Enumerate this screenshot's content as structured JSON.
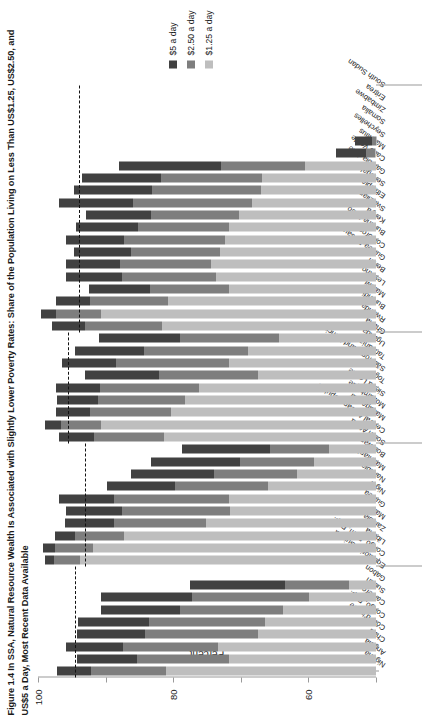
{
  "figure": {
    "title": "Figure 1.4  In SSA, Natural Resource Wealth Is Associated with Slightly Lower Poverty Rates: Share of the Population Living on Less Than US$1.25, US$2.50, and US$5 a Day, Most Recent Data Available"
  },
  "legend": {
    "position": "right",
    "items": [
      {
        "label": "$5 a day",
        "color": "#414141"
      },
      {
        "label": "$2.50 a day",
        "color": "#7e7e7e"
      },
      {
        "label": "$1.25 a day",
        "color": "#bebebe"
      }
    ]
  },
  "axis": {
    "ylabel": "Percent",
    "yticks": [
      "0",
      "20",
      "40",
      "60",
      "80",
      "100"
    ],
    "ymin": 0,
    "ymax": 100
  },
  "chart_data": {
    "type": "bar",
    "title": "Figure 1.4  In SSA, Natural Resource Wealth Is Associated with Slightly Lower Poverty Rates: Share of the Population Living on Less Than US$1.25, US$2.50, and US$5 a Day, Most Recent Data Available",
    "orientation": "horizontal-stacked",
    "stacked": true,
    "xlabel": "",
    "ylabel": "Percent",
    "ylim": [
      0,
      100
    ],
    "grid": false,
    "legend_position": "right",
    "categories": [
      "Nigeria",
      "Angola",
      "Chad",
      "Côte d'Ivoire",
      "Congo, Rep.",
      "Cameroon",
      "Sudan",
      "Gabon",
      "Equatorial Guinea",
      "Congo, Dem. Rep.",
      "Liberia",
      "Zambia",
      "Mali",
      "Guinea",
      "Niger",
      "Namibia",
      "Mauritania",
      "Botswana",
      "South Africa",
      "Central African Republic",
      "Madagascar",
      "Mozambique",
      "Sierra Leone",
      "Togo",
      "São Tomé and Príncipe",
      "Tanzania",
      "Uganda",
      "Ghana",
      "Rwanda",
      "Burundi",
      "Malawi",
      "Lesotho",
      "Benin",
      "Guinea-Bissau",
      "Comoros",
      "Burkina Faso",
      "Kenya",
      "Swaziland",
      "Ethiopia",
      "Senegal",
      "Gambia, The",
      "Cabo Verde",
      "Mauritius",
      "Seychelles",
      "Somalia",
      "Zimbabwe",
      "Eritrea",
      "South Sudan"
    ],
    "series": [
      {
        "name": "$1.25 a day",
        "color": "#bebebe",
        "values": [
          62.0,
          43.4,
          46.7,
          35.0,
          32.8,
          27.6,
          19.8,
          8.0,
          0.0,
          87.7,
          83.8,
          74.5,
          50.4,
          43.3,
          43.6,
          31.9,
          23.4,
          18.2,
          13.8,
          62.8,
          81.3,
          60.7,
          56.6,
          52.5,
          34.8,
          43.5,
          38.0,
          28.6,
          63.2,
          81.3,
          61.6,
          43.4,
          47.3,
          48.9,
          46.1,
          44.6,
          43.4,
          40.6,
          36.8,
          34.1,
          33.6,
          21.0,
          0.4,
          0.1,
          0.0,
          0.0,
          0.0,
          0.0
        ]
      },
      {
        "name": "$2.50 a day",
        "color": "#7e7e7e",
        "values": [
          22.3,
          27.2,
          28.3,
          33.4,
          34.3,
          30.3,
          34.7,
          19.0,
          0.0,
          7.5,
          11.1,
          14.5,
          27.0,
          31.8,
          33.8,
          27.6,
          24.6,
          21.9,
          17.5,
          20.5,
          11.9,
          23.8,
          25.7,
          29.1,
          29.3,
          33.5,
          30.5,
          29.5,
          22.9,
          13.5,
          23.0,
          23.4,
          28.0,
          26.9,
          26.3,
          30.1,
          27.0,
          26.1,
          35.1,
          32.3,
          30.0,
          25.0,
          2.5,
          1.0,
          0.0,
          0.0,
          0.0,
          0.0
        ]
      },
      {
        "name": "$5 a day",
        "color": "#414141",
        "values": [
          10.0,
          17.8,
          16.8,
          20.0,
          21.0,
          23.5,
          27.0,
          28.0,
          0.0,
          2.8,
          3.5,
          6.0,
          14.5,
          16.5,
          16.4,
          20.0,
          24.5,
          26.5,
          26.0,
          10.5,
          4.6,
          10.1,
          12.0,
          13.0,
          22.0,
          16.0,
          20.5,
          24.0,
          9.9,
          4.2,
          10.1,
          18.0,
          16.5,
          16.0,
          17.0,
          17.0,
          18.5,
          19.0,
          22.0,
          23.0,
          23.5,
          30.0,
          9.0,
          5.0,
          0.0,
          0.0,
          0.0,
          0.0
        ]
      }
    ],
    "groups": [
      {
        "name": "Oil and mineral rich",
        "start": 0,
        "end": 8,
        "mean": 89.0
      },
      {
        "name": "Mineral rich",
        "start": 9,
        "end": 18,
        "mean": 86.0
      },
      {
        "name": "Other resource",
        "start": 19,
        "end": 27,
        "mean": 91.0
      },
      {
        "name": "Non-resource rich",
        "start": 28,
        "end": 47,
        "mean": 88.0
      }
    ],
    "reference_lines": [
      {
        "value": 33.5,
        "style": "dashed"
      },
      {
        "value": 66.5,
        "style": "dashed"
      },
      {
        "value": 89.0,
        "style": "dashed"
      }
    ]
  }
}
